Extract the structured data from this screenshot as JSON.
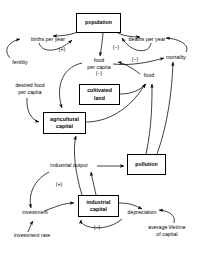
{
  "diagram": {
    "type": "causal-loop-diagram",
    "title": "",
    "stocks": [
      {
        "id": "population",
        "label": "population",
        "x": 76,
        "y": 13,
        "w": 45,
        "h": 20
      },
      {
        "id": "cultivated-land",
        "label": "cultivated\nland",
        "x": 79,
        "y": 84,
        "w": 41,
        "h": 21
      },
      {
        "id": "agricultural-capital",
        "label": "agricultural\ncapital",
        "x": 43,
        "y": 112,
        "w": 43,
        "h": 22
      },
      {
        "id": "pollution",
        "label": "pollution",
        "x": 127,
        "y": 154,
        "w": 39,
        "h": 21
      },
      {
        "id": "industrial-capital",
        "label": "industrial\ncapital",
        "x": 78,
        "y": 195,
        "w": 41,
        "h": 22
      }
    ],
    "flows": [
      {
        "id": "births-per-year",
        "label": "births per year",
        "x": 24,
        "y": 37,
        "w": 48,
        "align": "center"
      },
      {
        "id": "deaths-per-year",
        "label": "deaths per year",
        "x": 122,
        "y": 37,
        "w": 50,
        "align": "center"
      },
      {
        "id": "fertility",
        "label": "fertility",
        "x": 6,
        "y": 61,
        "w": 30,
        "align": "left"
      },
      {
        "id": "mortality",
        "label": "mortality",
        "x": 159,
        "y": 55,
        "w": 36,
        "align": "left"
      },
      {
        "id": "food-per-capita",
        "label": "food\nper capita",
        "x": 79,
        "y": 60,
        "w": 40,
        "align": "center"
      },
      {
        "id": "food",
        "label": "food",
        "x": 141,
        "y": 74,
        "w": 20,
        "align": "center"
      },
      {
        "id": "desired-food-per-capita",
        "label": "desired food\nper capita",
        "x": 6,
        "y": 84,
        "w": 50,
        "align": "center"
      },
      {
        "id": "industrial-output",
        "label": "industrial output",
        "x": 41,
        "y": 163,
        "w": 54,
        "align": "center"
      },
      {
        "id": "investment",
        "label": "investment",
        "x": 15,
        "y": 212,
        "w": 42,
        "align": "center"
      },
      {
        "id": "investment-rate",
        "label": "investment rate",
        "x": 7,
        "y": 235,
        "w": 52,
        "align": "center"
      },
      {
        "id": "depreciation",
        "label": "depreciation",
        "x": 120,
        "y": 212,
        "w": 42,
        "align": "center"
      },
      {
        "id": "average-lifetime-of-capital",
        "label": "average lifetime\nof capital",
        "x": 139,
        "y": 227,
        "w": 56,
        "align": "center"
      }
    ],
    "signs": [
      {
        "id": "sign-births-plus",
        "label": "(+)",
        "x": 58,
        "y": 49
      },
      {
        "id": "sign-deaths-minus",
        "label": "(−)",
        "x": 112,
        "y": 47
      },
      {
        "id": "sign-mortality-minus",
        "label": "(−)",
        "x": 131,
        "y": 59
      },
      {
        "id": "sign-food-per-capita-minus",
        "label": "(−)",
        "x": 92,
        "y": 74
      },
      {
        "id": "sign-investment-plus",
        "label": "(+)",
        "x": 55,
        "y": 184
      },
      {
        "id": "sign-depreciation-minus",
        "label": "(−)",
        "x": 93,
        "y": 227
      }
    ],
    "edges": [
      {
        "from": "population",
        "to": "births-per-year",
        "sign": "+"
      },
      {
        "from": "births-per-year",
        "to": "population",
        "sign": "+"
      },
      {
        "from": "fertility",
        "to": "births-per-year",
        "sign": "+"
      },
      {
        "from": "population",
        "to": "deaths-per-year",
        "sign": "-"
      },
      {
        "from": "deaths-per-year",
        "to": "population",
        "sign": "-"
      },
      {
        "from": "mortality",
        "to": "deaths-per-year",
        "sign": "-"
      },
      {
        "from": "population",
        "to": "food-per-capita",
        "sign": "-"
      },
      {
        "from": "food-per-capita",
        "to": "mortality",
        "sign": "-"
      },
      {
        "from": "food",
        "to": "food-per-capita",
        "sign": "+"
      },
      {
        "from": "food-per-capita",
        "to": "agricultural-capital",
        "sign": "-"
      },
      {
        "from": "desired-food-per-capita",
        "to": "agricultural-capital",
        "sign": "+"
      },
      {
        "from": "agricultural-capital",
        "to": "food",
        "sign": "+"
      },
      {
        "from": "cultivated-land",
        "to": "food",
        "sign": "+"
      },
      {
        "from": "pollution",
        "to": "food",
        "sign": "-"
      },
      {
        "from": "pollution",
        "to": "mortality",
        "sign": "+"
      },
      {
        "from": "industrial-output",
        "to": "pollution",
        "sign": "+"
      },
      {
        "from": "industrial-capital",
        "to": "industrial-output",
        "sign": "+"
      },
      {
        "from": "industrial-output",
        "to": "investment",
        "sign": "+"
      },
      {
        "from": "investment",
        "to": "industrial-capital",
        "sign": "+"
      },
      {
        "from": "investment-rate",
        "to": "investment",
        "sign": "+"
      },
      {
        "from": "industrial-capital",
        "to": "depreciation",
        "sign": "-"
      },
      {
        "from": "depreciation",
        "to": "industrial-capital",
        "sign": "-"
      },
      {
        "from": "average-lifetime-of-capital",
        "to": "depreciation",
        "sign": "-"
      },
      {
        "from": "industrial-capital",
        "to": "agricultural-capital",
        "sign": "+"
      }
    ],
    "colors": {
      "stroke": "#000000",
      "background": "#ffffff",
      "text": "#000000"
    }
  }
}
